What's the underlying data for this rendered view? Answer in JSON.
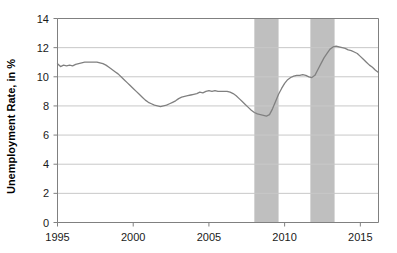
{
  "chart_data": {
    "type": "line",
    "title": "",
    "xlabel": "",
    "ylabel": "Unemployment Rate, in %",
    "xlim": [
      1995,
      2016.2
    ],
    "ylim": [
      0,
      14
    ],
    "grid": true,
    "legend": "none",
    "y_ticks": [
      0,
      2,
      4,
      6,
      8,
      10,
      12,
      14
    ],
    "y_tick_labels": [
      "0",
      "2",
      "4",
      "6",
      "8",
      "10",
      "12",
      "14"
    ],
    "x_ticks": [
      1995,
      2000,
      2005,
      2010,
      2015
    ],
    "x_tick_labels": [
      "1995",
      "2000",
      "2005",
      "2010",
      "2015"
    ],
    "line_color": "#808080",
    "band_color": "#bfbfbf",
    "grid_color": "#c8c8c8",
    "axis_color": "#808080",
    "shaded_regions": [
      {
        "name": "recession-band-1",
        "start": 2008.0,
        "end": 2009.6
      },
      {
        "name": "recession-band-2",
        "start": 2011.7,
        "end": 2013.3
      }
    ],
    "series": [
      {
        "name": "Unemployment Rate",
        "x": [
          1995.0,
          1995.2,
          1995.4,
          1995.6,
          1995.8,
          1996.0,
          1996.2,
          1996.4,
          1996.6,
          1996.8,
          1997.0,
          1997.2,
          1997.4,
          1997.6,
          1997.8,
          1998.0,
          1998.2,
          1998.4,
          1998.6,
          1998.8,
          1999.0,
          1999.2,
          1999.4,
          1999.6,
          1999.8,
          2000.0,
          2000.2,
          2000.4,
          2000.6,
          2000.8,
          2001.0,
          2001.2,
          2001.4,
          2001.6,
          2001.8,
          2002.0,
          2002.2,
          2002.4,
          2002.6,
          2002.8,
          2003.0,
          2003.2,
          2003.4,
          2003.6,
          2003.8,
          2004.0,
          2004.2,
          2004.4,
          2004.6,
          2004.8,
          2005.0,
          2005.2,
          2005.4,
          2005.6,
          2005.8,
          2006.0,
          2006.2,
          2006.4,
          2006.6,
          2006.8,
          2007.0,
          2007.2,
          2007.4,
          2007.6,
          2007.8,
          2008.0,
          2008.2,
          2008.4,
          2008.6,
          2008.8,
          2009.0,
          2009.2,
          2009.4,
          2009.6,
          2009.8,
          2010.0,
          2010.2,
          2010.4,
          2010.6,
          2010.8,
          2011.0,
          2011.2,
          2011.4,
          2011.6,
          2011.8,
          2012.0,
          2012.2,
          2012.4,
          2012.6,
          2012.8,
          2013.0,
          2013.2,
          2013.4,
          2013.6,
          2013.8,
          2014.0,
          2014.2,
          2014.4,
          2014.6,
          2014.8,
          2015.0,
          2015.2,
          2015.4,
          2015.6,
          2015.8,
          2016.0,
          2016.2
        ],
        "y": [
          10.9,
          10.7,
          10.8,
          10.75,
          10.8,
          10.75,
          10.85,
          10.9,
          10.95,
          11.0,
          11.0,
          11.0,
          11.0,
          11.0,
          10.95,
          10.9,
          10.8,
          10.65,
          10.5,
          10.35,
          10.2,
          10.0,
          9.8,
          9.6,
          9.4,
          9.2,
          9.0,
          8.8,
          8.6,
          8.4,
          8.25,
          8.15,
          8.05,
          8.0,
          7.95,
          8.0,
          8.05,
          8.15,
          8.25,
          8.35,
          8.5,
          8.6,
          8.65,
          8.7,
          8.75,
          8.8,
          8.85,
          8.95,
          8.9,
          9.0,
          9.05,
          9.0,
          9.05,
          9.0,
          9.0,
          9.0,
          9.0,
          8.95,
          8.85,
          8.7,
          8.5,
          8.3,
          8.1,
          7.9,
          7.7,
          7.55,
          7.45,
          7.4,
          7.35,
          7.3,
          7.4,
          7.8,
          8.3,
          8.8,
          9.2,
          9.55,
          9.8,
          9.95,
          10.05,
          10.1,
          10.1,
          10.15,
          10.1,
          10.0,
          9.95,
          10.1,
          10.5,
          10.9,
          11.3,
          11.6,
          11.9,
          12.05,
          12.1,
          12.05,
          12.0,
          11.95,
          11.85,
          11.8,
          11.7,
          11.6,
          11.4,
          11.2,
          11.0,
          10.8,
          10.65,
          10.45,
          10.3
        ]
      }
    ]
  }
}
